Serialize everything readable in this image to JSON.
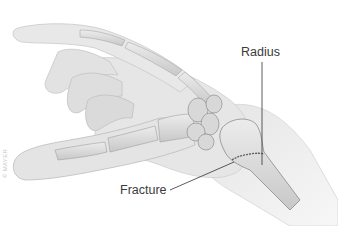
{
  "diagram": {
    "labels": {
      "radius": "Radius",
      "fracture": "Fracture"
    },
    "watermark": "© MAYER",
    "colors": {
      "background": "#ffffff",
      "skin": "#e9e9e9",
      "skin_shadow": "#cfcfcf",
      "bone": "#dcdcdc",
      "bone_outline": "#9a9a9a",
      "leader_line": "#333333",
      "label_text": "#3a3a3a",
      "fracture_line": "#6a6a6a"
    }
  }
}
